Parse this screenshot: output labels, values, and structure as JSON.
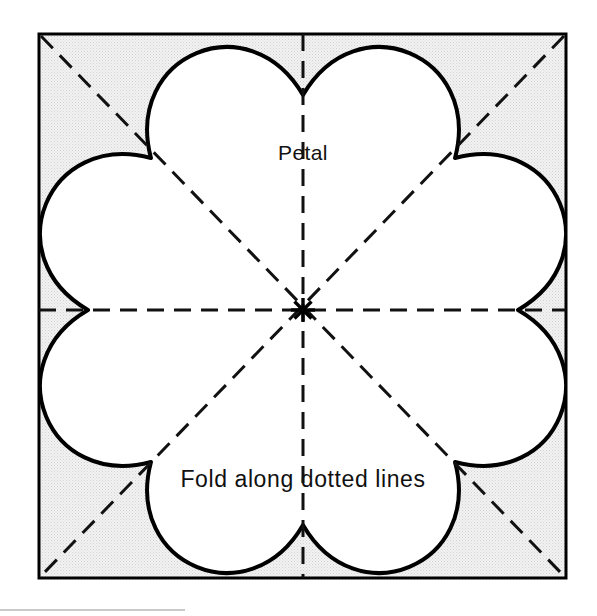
{
  "figure": {
    "canvas": {
      "width": 597,
      "height": 616,
      "background": "#ffffff"
    },
    "square": {
      "name": "paper-square",
      "left": 39,
      "top": 34,
      "right": 566,
      "bottom": 578,
      "stroke_color": "#000000",
      "stroke_width": 3,
      "fill_color": "#e9e9e9",
      "fill_description": "light gray halftone screen"
    },
    "flower": {
      "name": "eight-petal-flower",
      "petal_count": 8,
      "center_x": 303,
      "center_y": 310,
      "outer_radius": 269,
      "cusp_radius": 215,
      "stroke_color": "#000000",
      "stroke_width": 4,
      "fill_color": "#ffffff"
    },
    "fold_lines": {
      "name": "fold-dashed-lines",
      "count": 4,
      "description": "two axis lines and two diagonals through the center",
      "stroke_color": "#111111",
      "stroke_width": 3,
      "dash": "17 10"
    },
    "center_mark": {
      "name": "center-asterisk",
      "glyph": "*",
      "x": 303,
      "y": 310,
      "color": "#000000"
    },
    "labels": [
      {
        "id": "petal-label",
        "text": "Petal",
        "x": 303,
        "y": 160,
        "anchor": "middle",
        "size": "normal"
      },
      {
        "id": "fold-instruction-label",
        "text": "Fold along dotted lines",
        "x": 303,
        "y": 487,
        "anchor": "middle",
        "size": "wide"
      }
    ],
    "footer_rule": {
      "name": "page-bottom-rule",
      "y": 610,
      "x1": 0,
      "x2": 185,
      "color": "#c9c9c9"
    }
  }
}
